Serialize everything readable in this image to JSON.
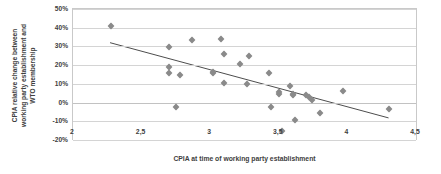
{
  "chart_data": {
    "type": "scatter",
    "title": "",
    "xlabel": "CPIA at time of working party establishment",
    "ylabel_lines": [
      "CPIA relative change between",
      "working party establishment and",
      "WTO membership"
    ],
    "ylabel": "CPIA relative change between working party establishment and WTO membership",
    "xlim": [
      2,
      4.5
    ],
    "ylim": [
      -0.2,
      0.5
    ],
    "xticks": [
      2,
      2.5,
      3,
      3.5,
      4,
      4.5
    ],
    "xticklabels": [
      "2",
      "2,5",
      "3",
      "3,5",
      "4",
      "4,5"
    ],
    "yticks": [
      -0.2,
      -0.1,
      0,
      0.1,
      0.2,
      0.3,
      0.4,
      0.5
    ],
    "yticklabels": [
      "-20%",
      "-10%",
      "0%",
      "10%",
      "20%",
      "30%",
      "40%",
      "50%"
    ],
    "grid": "horizontal",
    "legend": "none",
    "marker_shape": "diamond",
    "marker_color": "#8a8a8a",
    "trendline_color": "#4d4d4d",
    "gridline_color": "#d4d4d4",
    "points": [
      {
        "x": 2.28,
        "y": 0.41
      },
      {
        "x": 2.7,
        "y": 0.295
      },
      {
        "x": 2.7,
        "y": 0.192
      },
      {
        "x": 2.7,
        "y": 0.158
      },
      {
        "x": 2.78,
        "y": 0.145
      },
      {
        "x": 2.75,
        "y": -0.022
      },
      {
        "x": 2.87,
        "y": 0.335
      },
      {
        "x": 3.02,
        "y": 0.163
      },
      {
        "x": 3.02,
        "y": 0.158
      },
      {
        "x": 3.08,
        "y": 0.34
      },
      {
        "x": 3.1,
        "y": 0.262
      },
      {
        "x": 3.1,
        "y": 0.105
      },
      {
        "x": 3.22,
        "y": 0.208
      },
      {
        "x": 3.28,
        "y": 0.25
      },
      {
        "x": 3.27,
        "y": 0.1
      },
      {
        "x": 3.43,
        "y": 0.156
      },
      {
        "x": 3.44,
        "y": -0.025
      },
      {
        "x": 3.5,
        "y": 0.055
      },
      {
        "x": 3.5,
        "y": 0.048
      },
      {
        "x": 3.52,
        "y": -0.152
      },
      {
        "x": 3.58,
        "y": 0.088
      },
      {
        "x": 3.6,
        "y": 0.045
      },
      {
        "x": 3.6,
        "y": 0.038
      },
      {
        "x": 3.62,
        "y": -0.095
      },
      {
        "x": 3.7,
        "y": 0.042
      },
      {
        "x": 3.72,
        "y": 0.03
      },
      {
        "x": 3.74,
        "y": 0.012
      },
      {
        "x": 3.8,
        "y": -0.055
      },
      {
        "x": 3.97,
        "y": 0.06
      },
      {
        "x": 4.3,
        "y": -0.033
      }
    ],
    "trendline": {
      "x0": 2.27,
      "y0": 0.32,
      "x1": 4.3,
      "y1": -0.082
    }
  }
}
